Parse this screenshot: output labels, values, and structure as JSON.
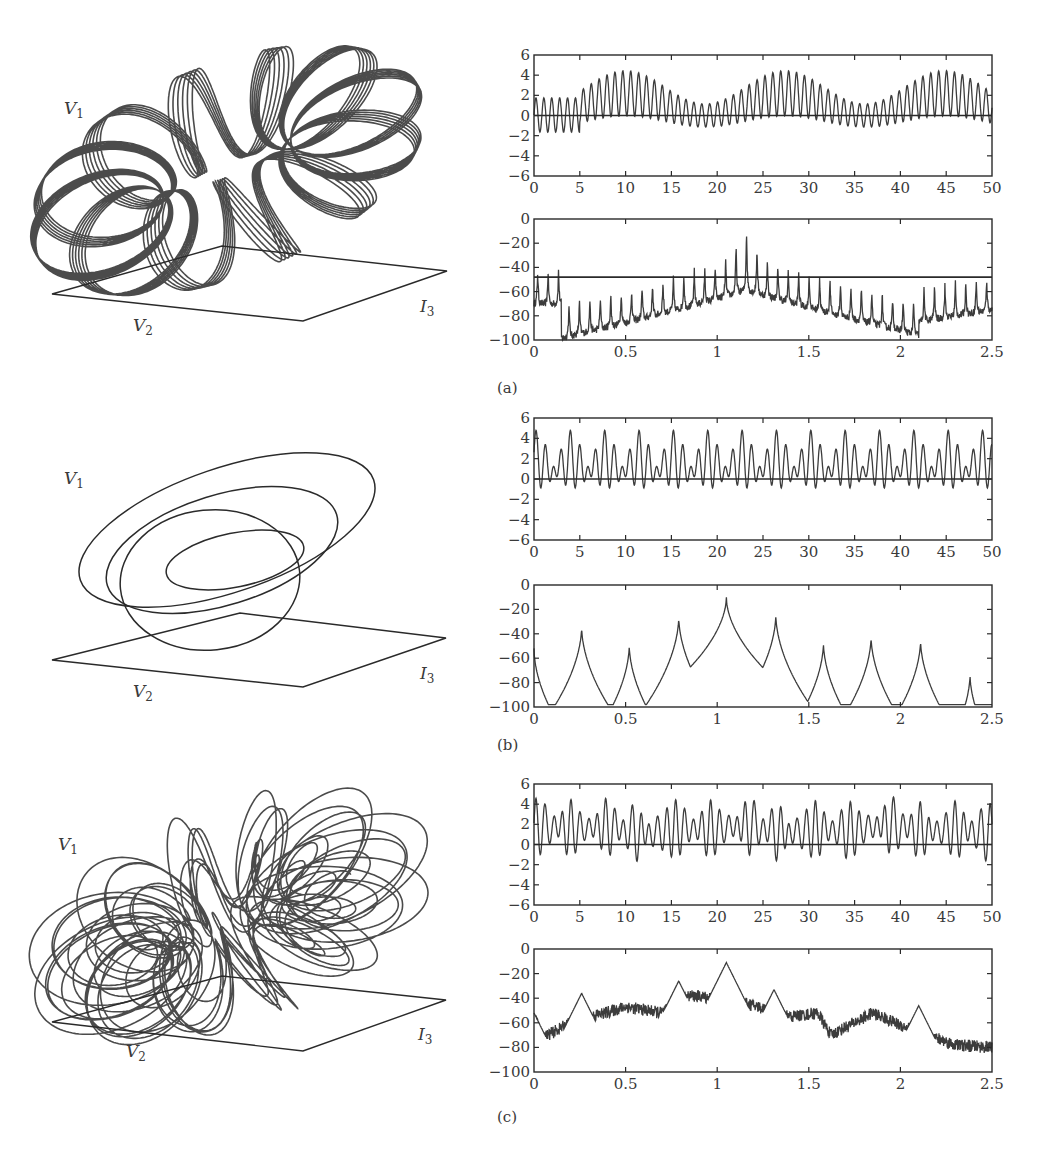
{
  "figure": {
    "panels": [
      {
        "label": "(a)",
        "regime": "quasi-periodic (torus)",
        "phase_portrait": {
          "axis_labels": {
            "vertical": "V",
            "vertical_sub": "1",
            "left": "V",
            "left_sub": "2",
            "right": "I",
            "right_sub": "3"
          }
        }
      },
      {
        "label": "(b)",
        "regime": "periodic",
        "phase_portrait": {
          "axis_labels": {
            "vertical": "V",
            "vertical_sub": "1",
            "left": "V",
            "left_sub": "2",
            "right": "I",
            "right_sub": "3"
          }
        }
      },
      {
        "label": "(c)",
        "regime": "chaotic",
        "phase_portrait": {
          "axis_labels": {
            "vertical": "V",
            "vertical_sub": "1",
            "left": "V",
            "left_sub": "2",
            "right": "I",
            "right_sub": "3"
          }
        }
      }
    ]
  },
  "chart_data": [
    {
      "id": "a-time",
      "type": "line",
      "title": "",
      "xlabel": "",
      "ylabel": "",
      "xlim": [
        0,
        50
      ],
      "ylim": [
        -6,
        6
      ],
      "xticks": [
        "0",
        "5",
        "10",
        "15",
        "20",
        "25",
        "30",
        "35",
        "40",
        "45",
        "50"
      ],
      "yticks": [
        "6",
        "4",
        "2",
        "0",
        "−2",
        "−4",
        "−6"
      ],
      "reference_line_y": 0,
      "description": "Fast oscillation (~1.15 Hz) with slow amplitude/offset modulation, period ~17.5; envelope peaks ~4.3 near t=10, 27, 45; minima ~-1.8",
      "envelope_peaks": [
        {
          "x": 10,
          "y": 4.3
        },
        {
          "x": 27.5,
          "y": 4.4
        },
        {
          "x": 45,
          "y": 4.4
        }
      ]
    },
    {
      "id": "a-spectrum",
      "type": "line",
      "xlim": [
        0,
        2.5
      ],
      "ylim": [
        -100,
        0
      ],
      "xticks": [
        "0",
        "0.5",
        "1",
        "1.5",
        "2",
        "2.5"
      ],
      "yticks": [
        "0",
        "−20",
        "−40",
        "−60",
        "−80",
        "−100"
      ],
      "reference_line_y": -48,
      "description": "Dense comb of sideband peaks spaced ~0.057 around main peak",
      "main_peak": {
        "x": 1.16,
        "y": -5
      },
      "major_peaks": [
        {
          "x": 1.1,
          "y": -20
        },
        {
          "x": 1.22,
          "y": -21
        },
        {
          "x": 1.04,
          "y": -32
        },
        {
          "x": 1.28,
          "y": -33
        },
        {
          "x": 0.05,
          "y": -43
        },
        {
          "x": 2.38,
          "y": -55
        }
      ]
    },
    {
      "id": "b-time",
      "type": "line",
      "xlim": [
        0,
        50
      ],
      "ylim": [
        -6,
        6
      ],
      "xticks": [
        "0",
        "5",
        "10",
        "15",
        "20",
        "25",
        "30",
        "35",
        "40",
        "45",
        "50"
      ],
      "yticks": [
        "6",
        "4",
        "2",
        "0",
        "−2",
        "−4",
        "−6"
      ],
      "reference_line_y": 0,
      "description": "Periodic waveform, repeating pattern period ~3.75, peaks ~4.4, minima ~-1.7"
    },
    {
      "id": "b-spectrum",
      "type": "line",
      "xlim": [
        0,
        2.5
      ],
      "ylim": [
        -100,
        0
      ],
      "xticks": [
        "0",
        "0.5",
        "1",
        "1.5",
        "2",
        "2.5"
      ],
      "yticks": [
        "0",
        "−20",
        "−40",
        "−60",
        "−80",
        "−100"
      ],
      "peaks": [
        {
          "x": 0.0,
          "y": -52
        },
        {
          "x": 0.26,
          "y": -34
        },
        {
          "x": 0.52,
          "y": -49
        },
        {
          "x": 0.79,
          "y": -26
        },
        {
          "x": 1.05,
          "y": -10
        },
        {
          "x": 1.32,
          "y": -24
        },
        {
          "x": 1.58,
          "y": -47
        },
        {
          "x": 1.84,
          "y": -42
        },
        {
          "x": 2.11,
          "y": -45
        },
        {
          "x": 2.38,
          "y": -73
        }
      ]
    },
    {
      "id": "c-time",
      "type": "line",
      "xlim": [
        0,
        50
      ],
      "ylim": [
        -6,
        6
      ],
      "xticks": [
        "0",
        "5",
        "10",
        "15",
        "20",
        "25",
        "30",
        "35",
        "40",
        "45",
        "50"
      ],
      "yticks": [
        "6",
        "4",
        "2",
        "0",
        "−2",
        "−4",
        "−6"
      ],
      "reference_line_y": 0,
      "description": "Irregular (chaotic) oscillation, peaks up to ~4.9, minima ~-2.1"
    },
    {
      "id": "c-spectrum",
      "type": "line",
      "xlim": [
        0,
        2.5
      ],
      "ylim": [
        -100,
        0
      ],
      "xticks": [
        "0",
        "0.5",
        "1",
        "1.5",
        "2",
        "2.5"
      ],
      "yticks": [
        "0",
        "−20",
        "−40",
        "−60",
        "−80",
        "−100"
      ],
      "description": "Broadband noisy spectrum with residual peaks",
      "peaks": [
        {
          "x": 0.0,
          "y": -52
        },
        {
          "x": 0.26,
          "y": -36
        },
        {
          "x": 0.79,
          "y": -26
        },
        {
          "x": 1.05,
          "y": -11
        },
        {
          "x": 1.31,
          "y": -33
        },
        {
          "x": 2.1,
          "y": -46
        }
      ],
      "baseline_profile": [
        {
          "x": 0.0,
          "y": -55
        },
        {
          "x": 0.05,
          "y": -72
        },
        {
          "x": 0.2,
          "y": -60
        },
        {
          "x": 0.5,
          "y": -47
        },
        {
          "x": 0.7,
          "y": -52
        },
        {
          "x": 0.85,
          "y": -38
        },
        {
          "x": 1.0,
          "y": -40
        },
        {
          "x": 1.2,
          "y": -46
        },
        {
          "x": 1.4,
          "y": -55
        },
        {
          "x": 1.55,
          "y": -52
        },
        {
          "x": 1.62,
          "y": -70
        },
        {
          "x": 1.85,
          "y": -52
        },
        {
          "x": 2.0,
          "y": -62
        },
        {
          "x": 2.15,
          "y": -70
        },
        {
          "x": 2.3,
          "y": -78
        },
        {
          "x": 2.5,
          "y": -80
        }
      ]
    }
  ]
}
